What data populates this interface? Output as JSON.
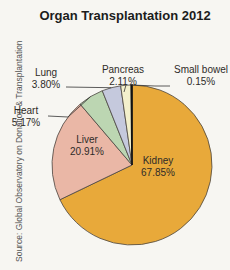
{
  "chart_data": {
    "type": "pie",
    "title": "Organ Transplantation 2012",
    "source": "Source: Global Observatory on Donation & Transplantation",
    "categories": [
      "Kidney",
      "Liver",
      "Heart",
      "Lung",
      "Pancreas",
      "Small bowel"
    ],
    "values": [
      67.85,
      20.91,
      5.17,
      3.8,
      2.11,
      0.15
    ],
    "labels": [
      "67.85%",
      "20.91%",
      "5.17%",
      "3.80%",
      "2.11%",
      "0.15%"
    ],
    "colors": [
      "#e8a93a",
      "#eab7a6",
      "#bcd6b2",
      "#c5c9dd",
      "#f3f0cc",
      "#f3f0cc"
    ],
    "start_angle": "12 o'clock, clockwise",
    "legend": "none (callout labels)"
  }
}
